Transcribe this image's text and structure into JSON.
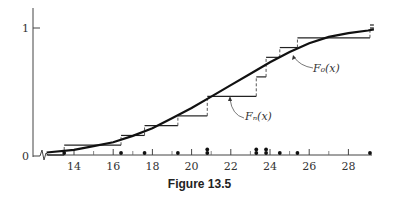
{
  "caption": "Figure 13.5",
  "chart_data": {
    "type": "line",
    "title": "",
    "caption": "Figure 13.5",
    "xlabel": "",
    "ylabel": "",
    "xlim": [
      12.5,
      29.5
    ],
    "ylim": [
      0,
      1.05
    ],
    "x_ticks": [
      14,
      16,
      18,
      20,
      22,
      24,
      26,
      28
    ],
    "x_minor_ticks": [
      15,
      17,
      19,
      21,
      23,
      25,
      27
    ],
    "y_ticks": [
      0,
      1
    ],
    "axis_break": true,
    "grid": false,
    "legend": "none (inline labels)",
    "series": [
      {
        "name": "F_n(x)",
        "label": "Fₙ(x)",
        "kind": "empirical step function",
        "steps": [
          {
            "x_start": 12.6,
            "x_end": 13.5,
            "y": 0.0
          },
          {
            "x_start": 13.5,
            "x_end": 16.4,
            "y": 0.077
          },
          {
            "x_start": 16.4,
            "x_end": 17.6,
            "y": 0.154
          },
          {
            "x_start": 17.6,
            "x_end": 19.3,
            "y": 0.231
          },
          {
            "x_start": 19.3,
            "x_end": 20.8,
            "y": 0.308
          },
          {
            "x_start": 20.8,
            "x_end": 23.3,
            "y": 0.462
          },
          {
            "x_start": 23.3,
            "x_end": 23.8,
            "y": 0.615
          },
          {
            "x_start": 23.8,
            "x_end": 24.5,
            "y": 0.769
          },
          {
            "x_start": 24.5,
            "x_end": 25.4,
            "y": 0.846
          },
          {
            "x_start": 25.4,
            "x_end": 29.1,
            "y": 0.923
          },
          {
            "x_start": 29.1,
            "x_end": 29.3,
            "y": 1.0
          }
        ]
      },
      {
        "name": "F_0(x)",
        "label": "F₀(x)",
        "kind": "smooth hypothesized CDF",
        "x": [
          12.6,
          14,
          15,
          16,
          17,
          18,
          19,
          20,
          21,
          22,
          23,
          24,
          25,
          26,
          27,
          28,
          29,
          29.3
        ],
        "y": [
          0.02,
          0.04,
          0.07,
          0.1,
          0.15,
          0.21,
          0.29,
          0.37,
          0.46,
          0.55,
          0.64,
          0.73,
          0.81,
          0.88,
          0.93,
          0.96,
          0.98,
          0.99
        ]
      }
    ],
    "sample_points": {
      "label": "observations on x-axis",
      "x": [
        13.5,
        16.4,
        17.6,
        19.3,
        20.8,
        20.8,
        23.3,
        23.3,
        23.8,
        23.8,
        24.5,
        25.4,
        29.1
      ]
    }
  }
}
